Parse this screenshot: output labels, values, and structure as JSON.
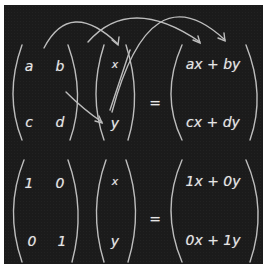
{
  "colors": {
    "board": "#1b1b1b",
    "chalk": "#e6e6e6",
    "frame": "#ffffff"
  },
  "top": {
    "matrix": {
      "r1c1": "a",
      "r1c2": "b",
      "r2c1": "c",
      "r2c2": "d"
    },
    "vector": {
      "r1": "x",
      "r2": "y"
    },
    "equals": "=",
    "result": {
      "r1": "ax + by",
      "r2": "cx + dy"
    }
  },
  "bottom": {
    "matrix": {
      "r1c1": "1",
      "r1c2": "0",
      "r2c1": "0",
      "r2c2": "1"
    },
    "vector": {
      "r1": "x",
      "r2": "y"
    },
    "equals": "=",
    "result": {
      "r1": "1x + 0y",
      "r2": "0x + 1y"
    }
  }
}
